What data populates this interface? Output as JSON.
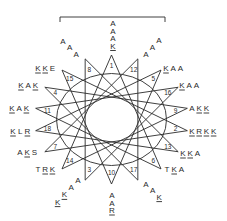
{
  "diagram": {
    "type": "helical-wheel",
    "center": [
      111.5,
      119.5
    ],
    "tip_radius": [
      77,
      64.5
    ],
    "inner_ellipse": [
      55,
      46
    ],
    "star_step": 7,
    "line_color": "#2a2a2a",
    "positions_clockwise_from_top": [
      1,
      12,
      5,
      16,
      9,
      2,
      13,
      6,
      17,
      10,
      3,
      14,
      7,
      18,
      11,
      4,
      15,
      8
    ],
    "bracket": {
      "x1": 60,
      "x2": 165,
      "y": 17,
      "tick": 5
    }
  },
  "labels": [
    {
      "pos": 1,
      "text": "AAAK",
      "layout": "vertical",
      "x": 113,
      "y": 26,
      "underline": [
        3
      ]
    },
    {
      "pos": 12,
      "text": "AAA",
      "layout": "diag-up-right",
      "x": 146,
      "y": 57,
      "underline": []
    },
    {
      "pos": 5,
      "text": "KAA",
      "layout": "row",
      "x": 166,
      "y": 71,
      "underline": [
        0
      ]
    },
    {
      "pos": 16,
      "text": "KAA",
      "layout": "row",
      "x": 182,
      "y": 88,
      "underline": [
        0
      ]
    },
    {
      "pos": 9,
      "text": "AKK",
      "layout": "row",
      "x": 192,
      "y": 111,
      "underline": [
        1,
        2
      ]
    },
    {
      "pos": 2,
      "text": "KRKK",
      "layout": "row",
      "x": 192,
      "y": 134,
      "underline": [
        0,
        1,
        2,
        3
      ]
    },
    {
      "pos": 13,
      "text": "KKA",
      "layout": "row",
      "x": 183,
      "y": 156,
      "underline": [
        0,
        1
      ]
    },
    {
      "pos": 6,
      "text": "TKA",
      "layout": "row",
      "x": 167,
      "y": 172,
      "underline": [
        1
      ]
    },
    {
      "pos": 17,
      "text": "AAK",
      "layout": "diag-down-right",
      "x": 146,
      "y": 187,
      "underline": [
        2
      ]
    },
    {
      "pos": 10,
      "text": "AAR",
      "layout": "vertical",
      "x": 112,
      "y": 198,
      "underline": [
        2
      ]
    },
    {
      "pos": 3,
      "text": "AAKK",
      "layout": "diag-down-left",
      "x": 78,
      "y": 183,
      "underline": [
        2,
        3
      ]
    },
    {
      "pos": 14,
      "text": "TRK",
      "layout": "row",
      "x": 38,
      "y": 172,
      "underline": [
        1,
        2
      ]
    },
    {
      "pos": 7,
      "text": "AKS",
      "layout": "row",
      "x": 20,
      "y": 155,
      "underline": [
        1
      ]
    },
    {
      "pos": 18,
      "text": "KLR",
      "layout": "row",
      "x": 13,
      "y": 134,
      "underline": [
        0,
        2
      ]
    },
    {
      "pos": 11,
      "text": "KAK",
      "layout": "row",
      "x": 12,
      "y": 111,
      "underline": [
        0,
        2
      ]
    },
    {
      "pos": 4,
      "text": "KAK",
      "layout": "row",
      "x": 21,
      "y": 88,
      "underline": [
        0,
        2
      ]
    },
    {
      "pos": 15,
      "text": "KKE",
      "layout": "row",
      "x": 38,
      "y": 71,
      "underline": [
        0,
        1
      ]
    },
    {
      "pos": 8,
      "text": "AAA",
      "layout": "diag-down-right",
      "x": 63,
      "y": 44,
      "underline": []
    }
  ]
}
